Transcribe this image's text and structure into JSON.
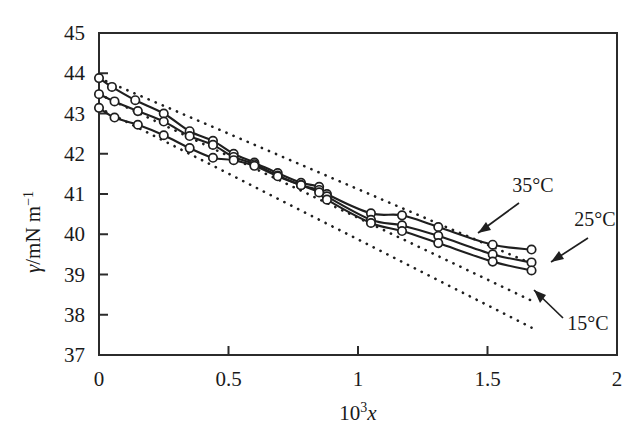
{
  "figure": {
    "background": "#ffffff",
    "ink_color": "#1f1f1f"
  },
  "axes": {
    "x_title": "10",
    "x_title_exponent": "3",
    "x_title_variable": "x",
    "y_title_symbol": "γ",
    "y_title_rest": "/mN m",
    "y_title_exponent": "−1",
    "x_tick_labels": [
      "0",
      "0.5",
      "1",
      "1.5",
      "2"
    ],
    "y_tick_labels": [
      "37",
      "38",
      "39",
      "40",
      "41",
      "42",
      "43",
      "44",
      "45"
    ]
  },
  "annotations": [
    {
      "name": "label-35c",
      "text": "35°C"
    },
    {
      "name": "label-25c",
      "text": "25°C"
    },
    {
      "name": "label-15c",
      "text": "15°C"
    }
  ],
  "chart_data": {
    "type": "line",
    "title": "",
    "xlabel": "10^3 x",
    "ylabel": "γ/mN m^-1",
    "xlim": [
      0,
      2
    ],
    "ylim": [
      37,
      45
    ],
    "xticks": [
      0,
      0.5,
      1,
      1.5,
      2
    ],
    "yticks": [
      37,
      38,
      39,
      40,
      41,
      42,
      43,
      44,
      45
    ],
    "grid": false,
    "legend": "inline-arrow-annotations",
    "marker": "open-circle",
    "series": [
      {
        "name": "15°C",
        "style": "solid-with-open-circle-markers",
        "points": [
          [
            0.0,
            43.88
          ],
          [
            0.05,
            43.66
          ],
          [
            0.14,
            43.33
          ],
          [
            0.25,
            43.0
          ],
          [
            0.35,
            42.56
          ],
          [
            0.44,
            42.32
          ],
          [
            0.52,
            42.0
          ],
          [
            0.6,
            41.78
          ],
          [
            0.69,
            41.52
          ],
          [
            0.78,
            41.28
          ],
          [
            0.85,
            41.18
          ],
          [
            0.88,
            41.0
          ],
          [
            1.05,
            40.52
          ],
          [
            1.17,
            40.47
          ],
          [
            1.31,
            40.18
          ],
          [
            1.52,
            39.74
          ],
          [
            1.67,
            39.62
          ]
        ]
      },
      {
        "name": "25°C",
        "style": "solid-with-open-circle-markers",
        "points": [
          [
            0.0,
            43.48
          ],
          [
            0.06,
            43.3
          ],
          [
            0.15,
            43.06
          ],
          [
            0.25,
            42.8
          ],
          [
            0.35,
            42.44
          ],
          [
            0.44,
            42.22
          ],
          [
            0.52,
            41.92
          ],
          [
            0.6,
            41.74
          ],
          [
            0.69,
            41.46
          ],
          [
            0.78,
            41.22
          ],
          [
            0.85,
            41.1
          ],
          [
            0.88,
            40.94
          ],
          [
            1.05,
            40.36
          ],
          [
            1.17,
            40.22
          ],
          [
            1.31,
            39.96
          ],
          [
            1.52,
            39.5
          ],
          [
            1.67,
            39.3
          ]
        ]
      },
      {
        "name": "35°C",
        "style": "solid-with-open-circle-markers",
        "points": [
          [
            0.0,
            43.14
          ],
          [
            0.06,
            42.9
          ],
          [
            0.15,
            42.72
          ],
          [
            0.25,
            42.46
          ],
          [
            0.35,
            42.14
          ],
          [
            0.44,
            41.9
          ],
          [
            0.52,
            41.84
          ],
          [
            0.6,
            41.7
          ],
          [
            0.69,
            41.44
          ],
          [
            0.78,
            41.22
          ],
          [
            0.85,
            41.04
          ],
          [
            0.88,
            40.86
          ],
          [
            1.05,
            40.28
          ],
          [
            1.17,
            40.08
          ],
          [
            1.31,
            39.78
          ],
          [
            1.52,
            39.32
          ],
          [
            1.67,
            39.1
          ]
        ]
      }
    ],
    "reference_lines": [
      {
        "name": "ideal-dotted-15C",
        "style": "dotted-straight",
        "from": [
          0.0,
          43.88
        ],
        "to": [
          1.67,
          39.27
        ]
      },
      {
        "name": "ideal-dotted-25C",
        "style": "dotted-straight",
        "from": [
          0.0,
          43.48
        ],
        "to": [
          1.67,
          38.35
        ]
      },
      {
        "name": "ideal-dotted-35C",
        "style": "dotted-straight",
        "from": [
          0.0,
          43.14
        ],
        "to": [
          1.67,
          37.68
        ]
      }
    ]
  }
}
